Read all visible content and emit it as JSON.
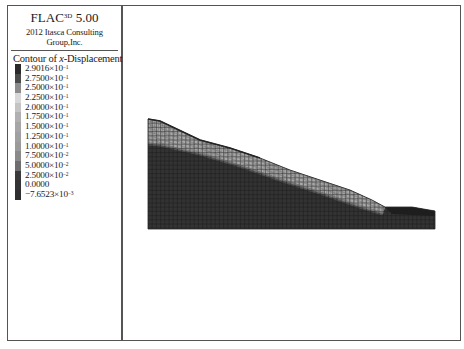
{
  "header": {
    "app_name": "FLAC",
    "app_superscript": "3D",
    "version": "5.00",
    "copyright": "2012 Itasca Consulting Group,Inc."
  },
  "legend": {
    "title_prefix": "Contour of ",
    "title_var": "x",
    "title_suffix": "-Displacement",
    "items": [
      {
        "mantissa": "2.9016",
        "exp": "-1",
        "color": "#2a2a2a"
      },
      {
        "mantissa": "2.7500",
        "exp": "-1",
        "color": "#4a4a4a"
      },
      {
        "mantissa": "2.5000",
        "exp": "-1",
        "color": "#8c8c8c"
      },
      {
        "mantissa": "2.2500",
        "exp": "-1",
        "color": "#d8d8d8"
      },
      {
        "mantissa": "2.0000",
        "exp": "-1",
        "color": "#c4c4c4"
      },
      {
        "mantissa": "1.7500",
        "exp": "-1",
        "color": "#b0b0b0"
      },
      {
        "mantissa": "1.5000",
        "exp": "-1",
        "color": "#a6a6a6"
      },
      {
        "mantissa": "1.2500",
        "exp": "-1",
        "color": "#a0a0a0"
      },
      {
        "mantissa": "1.0000",
        "exp": "-1",
        "color": "#9a9a9a"
      },
      {
        "mantissa": "7.5000",
        "exp": "-2",
        "color": "#8a8a8a"
      },
      {
        "mantissa": "5.0000",
        "exp": "-2",
        "color": "#6e6e6e"
      },
      {
        "mantissa": "2.5000",
        "exp": "-2",
        "color": "#3a3a3a"
      },
      {
        "mantissa": "0.0000",
        "exp": "",
        "color": "#333333"
      },
      {
        "mantissa": "-7.6523",
        "exp": "-3",
        "color": "#2e2e2e"
      }
    ],
    "times_symbol": "×10"
  },
  "plot": {
    "model_outline": [
      [
        148,
        119
      ],
      [
        160,
        121
      ],
      [
        200,
        140
      ],
      [
        230,
        148
      ],
      [
        260,
        158
      ],
      [
        290,
        170
      ],
      [
        320,
        180
      ],
      [
        350,
        190
      ],
      [
        372,
        200
      ],
      [
        385,
        207
      ],
      [
        412,
        207
      ],
      [
        435,
        211
      ],
      [
        435,
        229
      ],
      [
        148,
        229
      ]
    ],
    "slide_layer_upper": [
      [
        148,
        119
      ],
      [
        160,
        121
      ],
      [
        200,
        140
      ],
      [
        230,
        148
      ],
      [
        260,
        158
      ],
      [
        290,
        170
      ],
      [
        320,
        180
      ],
      [
        350,
        190
      ],
      [
        372,
        200
      ],
      [
        385,
        207
      ],
      [
        383,
        214
      ]
    ],
    "slide_layer_lower": [
      [
        383,
        214
      ],
      [
        360,
        207
      ],
      [
        320,
        193
      ],
      [
        280,
        180
      ],
      [
        240,
        166
      ],
      [
        200,
        154
      ],
      [
        160,
        145
      ],
      [
        148,
        144
      ]
    ],
    "colors": {
      "base": "#333333",
      "slide": "#a8a8a8",
      "mesh": "#1f1f1f",
      "mesh_light": "#6a6a6a",
      "crest_dark": "#1c1c1c"
    }
  }
}
